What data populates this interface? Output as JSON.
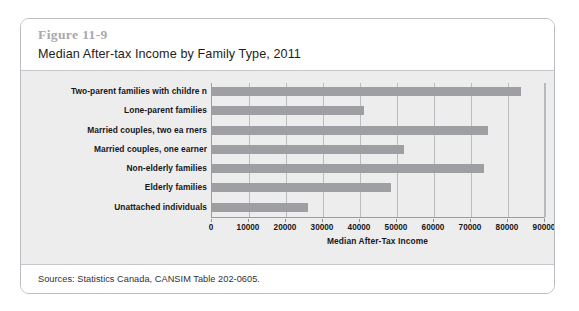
{
  "figure": {
    "number": "Figure 11-9",
    "title": "Median After-tax Income by Family Type, 2011",
    "sources": "Sources: Statistics Canada, CANSIM Table 202-0605."
  },
  "colors": {
    "bar": "#9d9fa2",
    "plot_background": "#ededee",
    "gridline": "#b9bcc0",
    "axis": "#9a9da1",
    "figure_number": "#a8a9ad"
  },
  "chart_data": {
    "type": "bar",
    "orientation": "horizontal",
    "title": "Median After-tax Income by Family Type, 2011",
    "xlabel": "Median After-Tax Income",
    "ylabel": "",
    "xlim": [
      0,
      90000
    ],
    "xticks": [
      0,
      10000,
      20000,
      30000,
      40000,
      50000,
      60000,
      70000,
      80000,
      90000
    ],
    "xtick_labels": [
      "0",
      "10000",
      "20000",
      "30000",
      "40000",
      "50000",
      "60000",
      "70000",
      "80000",
      "90000"
    ],
    "grid": "vertical",
    "legend": "none",
    "categories": [
      "Two-parent families with childre n",
      "Lone-parent families",
      "Married couples, two ea rners",
      "Married couples, one earner",
      "Non-elderly families",
      "Elderly families",
      "Unattached individuals"
    ],
    "values": [
      83500,
      41000,
      74500,
      52000,
      73500,
      48500,
      26000
    ]
  }
}
